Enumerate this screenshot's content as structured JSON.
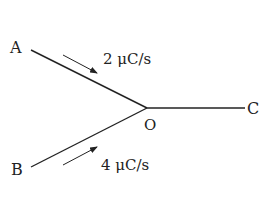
{
  "diagram": {
    "nodes": [
      {
        "id": "A",
        "label": "A"
      },
      {
        "id": "B",
        "label": "B"
      },
      {
        "id": "O",
        "label": "O"
      },
      {
        "id": "C",
        "label": "C"
      }
    ],
    "edges": [
      {
        "from": "A",
        "to": "O",
        "current_label": "2 μC/s",
        "arrow_direction": "toward O"
      },
      {
        "from": "B",
        "to": "O",
        "current_label": "4 μC/s",
        "arrow_direction": "toward O"
      },
      {
        "from": "O",
        "to": "C",
        "current_label": ""
      }
    ],
    "colors": {
      "line": "#222222",
      "background": "#ffffff"
    }
  }
}
